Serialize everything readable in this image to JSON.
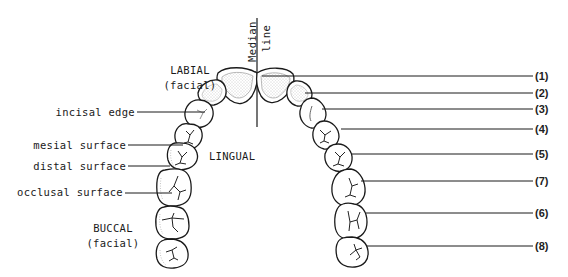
{
  "diagram": {
    "type": "dental arch diagram (maxillary teeth, occlusal view)",
    "median_line": {
      "label_line1": "Median",
      "label_line2": "line"
    },
    "regions": {
      "labial": {
        "line1": "LABIAL",
        "line2": "(facial)"
      },
      "lingual": "LINGUAL",
      "buccal": {
        "line1": "BUCCAL",
        "line2": "(facial)"
      }
    },
    "left_callouts": [
      {
        "label": "incisal edge"
      },
      {
        "label": "mesial surface"
      },
      {
        "label": "distal surface"
      },
      {
        "label": "occlusal surface"
      }
    ],
    "right_callouts": [
      {
        "label": "(1)"
      },
      {
        "label": "(2)"
      },
      {
        "label": "(3)"
      },
      {
        "label": "(4)"
      },
      {
        "label": "(5)"
      },
      {
        "label": "(7)"
      },
      {
        "label": "(6)"
      },
      {
        "label": "(8)"
      }
    ],
    "colors": {
      "line": "#1a1a1a",
      "stipple": "#9a9a9a",
      "background": "#ffffff"
    }
  }
}
